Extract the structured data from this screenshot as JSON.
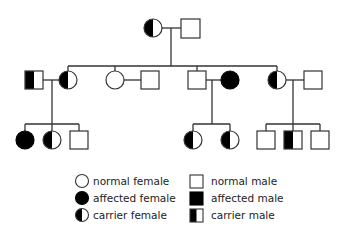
{
  "diagram": {
    "type": "pedigree",
    "colors": {
      "stroke": "#333333",
      "fill_affected": "#000000",
      "fill_normal": "#ffffff"
    },
    "generations": [
      {
        "label": "I",
        "individuals": [
          {
            "id": "I-1",
            "sex": "female",
            "status": "carrier"
          },
          {
            "id": "I-2",
            "sex": "male",
            "status": "normal"
          }
        ]
      },
      {
        "label": "II",
        "individuals": [
          {
            "id": "II-1",
            "sex": "male",
            "status": "carrier",
            "note": "spouse"
          },
          {
            "id": "II-2",
            "sex": "female",
            "status": "carrier"
          },
          {
            "id": "II-3",
            "sex": "female",
            "status": "normal"
          },
          {
            "id": "II-4",
            "sex": "male",
            "status": "normal",
            "note": "spouse"
          },
          {
            "id": "II-5",
            "sex": "male",
            "status": "normal"
          },
          {
            "id": "II-6",
            "sex": "female",
            "status": "affected",
            "note": "spouse"
          },
          {
            "id": "II-7",
            "sex": "female",
            "status": "carrier"
          },
          {
            "id": "II-8",
            "sex": "male",
            "status": "normal",
            "note": "spouse"
          }
        ]
      },
      {
        "label": "III",
        "individuals": [
          {
            "id": "III-1",
            "sex": "female",
            "status": "affected"
          },
          {
            "id": "III-2",
            "sex": "female",
            "status": "carrier"
          },
          {
            "id": "III-3",
            "sex": "male",
            "status": "normal"
          },
          {
            "id": "III-4",
            "sex": "female",
            "status": "carrier"
          },
          {
            "id": "III-5",
            "sex": "female",
            "status": "carrier"
          },
          {
            "id": "III-6",
            "sex": "male",
            "status": "normal"
          },
          {
            "id": "III-7",
            "sex": "male",
            "status": "carrier"
          },
          {
            "id": "III-8",
            "sex": "male",
            "status": "normal"
          }
        ]
      }
    ]
  },
  "legend": {
    "items": [
      {
        "symbol": "circle-empty",
        "label": "normal female"
      },
      {
        "symbol": "circle-filled",
        "label": "affected female"
      },
      {
        "symbol": "circle-half",
        "label": "carrier female"
      },
      {
        "symbol": "square-empty",
        "label": "normal male"
      },
      {
        "symbol": "square-filled",
        "label": "affected male"
      },
      {
        "symbol": "square-half",
        "label": "carrier male"
      }
    ]
  }
}
